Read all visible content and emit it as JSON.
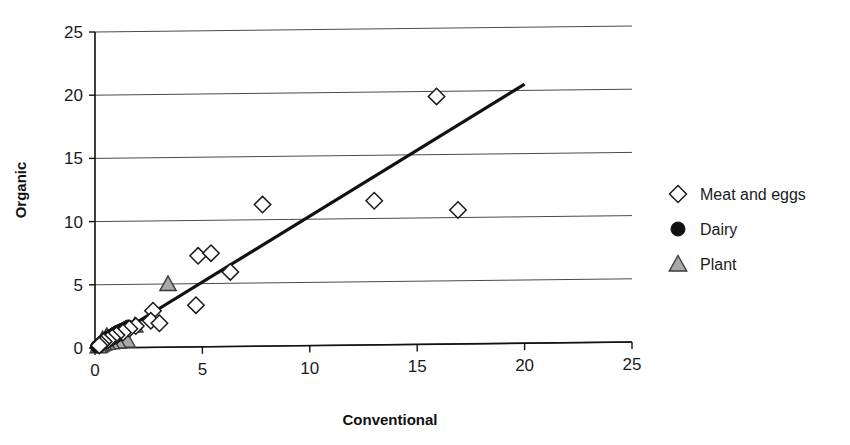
{
  "chart_data": {
    "type": "scatter",
    "title": "",
    "xlabel": "Conventional",
    "ylabel": "Organic",
    "xlim": [
      0,
      25
    ],
    "ylim": [
      0,
      25
    ],
    "xticks": [
      0,
      5,
      10,
      15,
      20,
      25
    ],
    "yticks": [
      0,
      5,
      10,
      15,
      20,
      25
    ],
    "grid": "horizontal",
    "legend_position": "right",
    "series": [
      {
        "name": "Meat and eggs",
        "marker": "open-diamond",
        "color": "#ffffff",
        "edge_color": "#1a1a1a",
        "points": [
          [
            15.9,
            19.6
          ],
          [
            7.8,
            11.2
          ],
          [
            13.0,
            11.4
          ],
          [
            16.9,
            10.6
          ],
          [
            4.8,
            7.2
          ],
          [
            5.4,
            7.4
          ],
          [
            6.3,
            5.9
          ],
          [
            4.7,
            3.3
          ],
          [
            2.7,
            2.9
          ],
          [
            2.6,
            2.1
          ],
          [
            3.0,
            1.9
          ],
          [
            1.9,
            1.7
          ],
          [
            1.6,
            1.5
          ],
          [
            1.3,
            1.2
          ],
          [
            1.0,
            1.0
          ],
          [
            0.8,
            0.8
          ],
          [
            0.6,
            0.6
          ],
          [
            0.4,
            0.5
          ],
          [
            0.3,
            0.3
          ],
          [
            0.2,
            0.2
          ]
        ]
      },
      {
        "name": "Dairy",
        "marker": "filled-circle",
        "color": "#111111",
        "edge_color": "#111111",
        "points": [
          [
            1.55,
            1.7
          ],
          [
            1.45,
            1.6
          ],
          [
            1.35,
            1.5
          ],
          [
            1.25,
            1.45
          ],
          [
            1.15,
            1.35
          ],
          [
            1.05,
            1.3
          ],
          [
            0.98,
            1.2
          ],
          [
            0.9,
            1.15
          ],
          [
            0.85,
            1.05
          ],
          [
            0.78,
            1.0
          ],
          [
            0.72,
            0.95
          ],
          [
            0.66,
            0.88
          ],
          [
            0.6,
            0.82
          ],
          [
            0.55,
            0.75
          ],
          [
            0.5,
            0.7
          ],
          [
            0.45,
            0.62
          ],
          [
            0.4,
            0.55
          ],
          [
            0.35,
            0.5
          ],
          [
            0.3,
            0.42
          ],
          [
            0.26,
            0.36
          ],
          [
            0.22,
            0.3
          ],
          [
            0.18,
            0.25
          ],
          [
            0.15,
            0.2
          ],
          [
            0.12,
            0.16
          ],
          [
            0.1,
            0.12
          ],
          [
            0.08,
            0.1
          ],
          [
            1.2,
            1.05
          ],
          [
            1.0,
            0.9
          ],
          [
            0.9,
            0.78
          ],
          [
            0.75,
            0.66
          ],
          [
            0.62,
            0.55
          ],
          [
            0.5,
            0.45
          ]
        ]
      },
      {
        "name": "Plant",
        "marker": "filled-triangle",
        "color": "#a8a8a8",
        "edge_color": "#3a3a3a",
        "points": [
          [
            3.4,
            5.0
          ],
          [
            1.85,
            1.75
          ],
          [
            1.5,
            0.55
          ],
          [
            1.05,
            0.5
          ],
          [
            0.75,
            0.45
          ],
          [
            0.55,
            0.4
          ],
          [
            0.4,
            0.35
          ],
          [
            0.3,
            0.28
          ],
          [
            0.22,
            0.2
          ],
          [
            0.15,
            0.14
          ],
          [
            0.55,
            0.95
          ],
          [
            0.35,
            0.7
          ]
        ]
      }
    ],
    "trendline": {
      "from": [
        0,
        0
      ],
      "to": [
        20,
        20.5
      ],
      "color": "#111111"
    }
  },
  "legend": {
    "items": [
      {
        "label": "Meat and eggs",
        "marker": "open-diamond"
      },
      {
        "label": "Dairy",
        "marker": "filled-circle"
      },
      {
        "label": "Plant",
        "marker": "filled-triangle"
      }
    ]
  },
  "axes": {
    "x_title": "Conventional",
    "y_title": "Organic",
    "x_tick_labels": [
      "0",
      "5",
      "10",
      "15",
      "20",
      "25"
    ],
    "y_tick_labels": [
      "0",
      "5",
      "10",
      "15",
      "20",
      "25"
    ]
  }
}
